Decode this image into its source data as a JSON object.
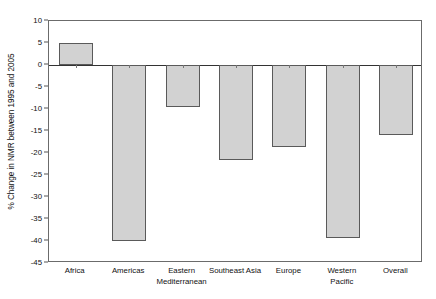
{
  "chart_data": {
    "type": "bar",
    "title": "",
    "xlabel": "",
    "ylabel": "% Change in NMR between 1995 and 2005",
    "categories": [
      "Africa",
      "Eastern\nMediterranean",
      "Americas",
      "Southeast Asia",
      "Europe",
      "Western\nPacific",
      "Overall"
    ],
    "categories_display": [
      {
        "line1": "Africa",
        "line2": ""
      },
      {
        "line1": "Americas",
        "line2": ""
      },
      {
        "line1": "Eastern",
        "line2": "Mediterranean"
      },
      {
        "line1": "Southeast Asia",
        "line2": ""
      },
      {
        "line1": "Europe",
        "line2": ""
      },
      {
        "line1": "Western",
        "line2": "Pacific"
      },
      {
        "line1": "Overall",
        "line2": ""
      }
    ],
    "values": [
      5,
      -40,
      -9.5,
      -21.5,
      -18.7,
      -39.3,
      -16
    ],
    "ylim": [
      -45,
      10
    ],
    "ytick_values": [
      10,
      5,
      0,
      -5,
      -10,
      -15,
      -20,
      -25,
      -30,
      -35,
      -40,
      -45
    ],
    "ytick_labels": [
      "10",
      "5",
      "0",
      "-5",
      "-10",
      "-15",
      "-20",
      "-25",
      "-30",
      "-35",
      "-40",
      "-45"
    ],
    "grid": false,
    "legend": "none",
    "bar_fill_color": "#d2d2d2",
    "bar_border_color": "#5a5a5a",
    "axis_color": "#6b6b6b",
    "zero_line_color": "#333333"
  }
}
